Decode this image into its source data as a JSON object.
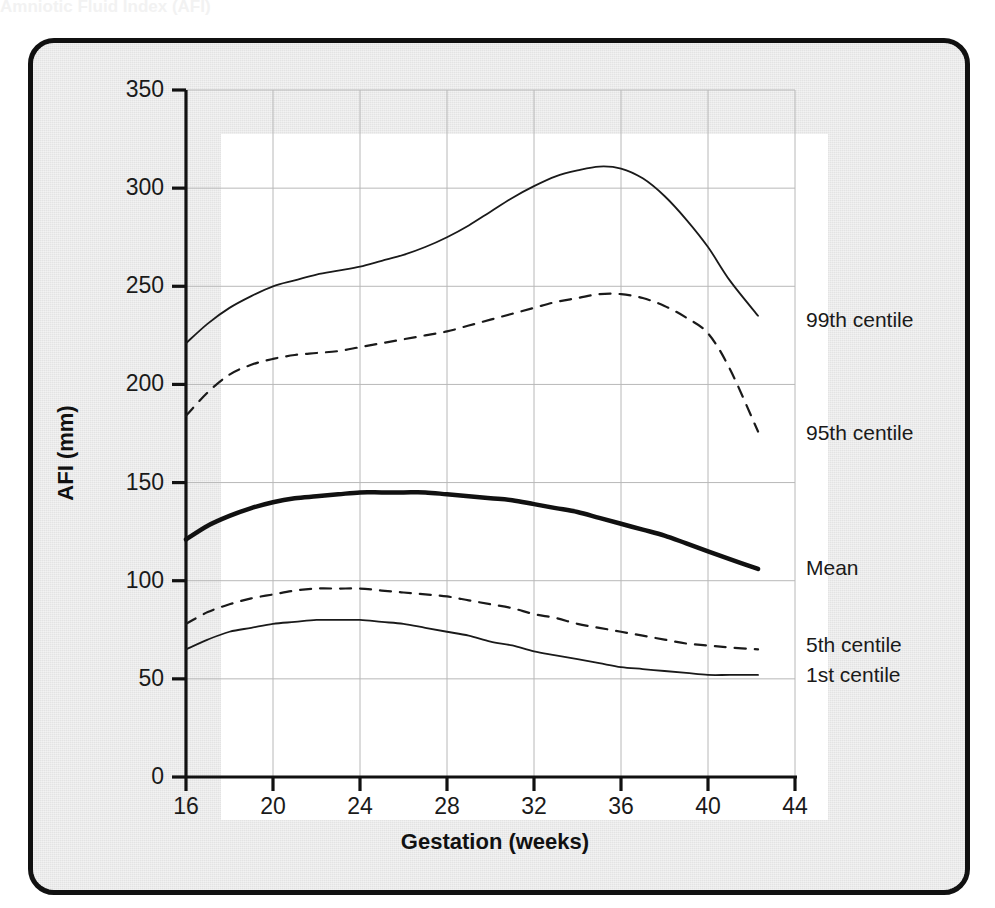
{
  "figure": {
    "cut_off_title": "Amniotic Fluid Index (AFI)",
    "frame_color": "#111111",
    "card_color": "#e3e3e3",
    "plot_background": "#ffffff"
  },
  "chart_data": {
    "type": "line",
    "title": "",
    "xlabel": "Gestation (weeks)",
    "ylabel": "AFI (mm)",
    "xlim": [
      16,
      44
    ],
    "ylim": [
      0,
      350
    ],
    "xticks": [
      16,
      20,
      24,
      28,
      32,
      36,
      40,
      44
    ],
    "yticks": [
      0,
      50,
      100,
      150,
      200,
      250,
      300,
      350
    ],
    "grid": true,
    "grid_color": "#b8b8b8",
    "legend_position": "right-inline-annotations",
    "x": [
      16,
      17,
      18,
      19,
      20,
      21,
      22,
      23,
      24,
      25,
      26,
      27,
      28,
      29,
      30,
      31,
      32,
      33,
      34,
      35,
      36,
      37,
      38,
      39,
      40,
      41,
      42.3
    ],
    "series": [
      {
        "name": "99th centile",
        "style": "solid",
        "width": 1.8,
        "color": "#1a1a1a",
        "values": [
          221,
          231,
          239,
          245,
          250,
          253,
          256,
          258,
          260,
          263,
          266,
          270,
          275,
          281,
          288,
          295,
          301,
          306,
          309,
          311,
          310,
          305,
          296,
          284,
          270,
          253,
          235
        ]
      },
      {
        "name": "95th centile",
        "style": "dashed",
        "width": 2.2,
        "color": "#1a1a1a",
        "values": [
          184,
          196,
          205,
          210,
          213,
          215,
          216,
          217,
          219,
          221,
          223,
          225,
          227,
          230,
          233,
          236,
          239,
          242,
          244,
          246,
          246,
          244,
          240,
          234,
          226,
          208,
          176
        ]
      },
      {
        "name": "Mean",
        "style": "solid",
        "width": 4.5,
        "color": "#111111",
        "values": [
          121,
          128,
          133,
          137,
          140,
          142,
          143,
          144,
          145,
          145,
          145,
          145,
          144,
          143,
          142,
          141,
          139,
          137,
          135,
          132,
          129,
          126,
          123,
          119,
          115,
          111,
          106
        ]
      },
      {
        "name": "5th centile",
        "style": "dashed",
        "width": 2.2,
        "color": "#1a1a1a",
        "values": [
          78,
          84,
          88,
          91,
          93,
          95,
          96,
          96,
          96,
          95,
          94,
          93,
          92,
          90,
          88,
          86,
          83,
          81,
          78,
          76,
          74,
          72,
          70,
          68,
          67,
          66,
          65
        ]
      },
      {
        "name": "1st centile",
        "style": "solid",
        "width": 1.8,
        "color": "#1a1a1a",
        "values": [
          65,
          70,
          74,
          76,
          78,
          79,
          80,
          80,
          80,
          79,
          78,
          76,
          74,
          72,
          69,
          67,
          64,
          62,
          60,
          58,
          56,
          55,
          54,
          53,
          52,
          52,
          52
        ]
      }
    ],
    "annotations": [
      {
        "text": "99th centile",
        "x_px": 806,
        "y_px": 308
      },
      {
        "text": "95th centile",
        "x_px": 806,
        "y_px": 421
      },
      {
        "text": "Mean",
        "x_px": 806,
        "y_px": 556
      },
      {
        "text": "5th centile",
        "x_px": 806,
        "y_px": 633
      },
      {
        "text": "1st centile",
        "x_px": 806,
        "y_px": 663
      }
    ]
  }
}
